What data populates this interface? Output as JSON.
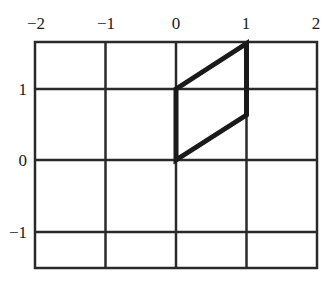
{
  "figure": {
    "x_ticks": [
      "−2",
      "−1",
      "0",
      "1",
      "2"
    ],
    "y_ticks": [
      "1",
      "0",
      "−1"
    ],
    "x_range": [
      -2,
      2
    ],
    "y_range": [
      -1.5,
      1.67
    ],
    "grid_color": "#2a2a2a",
    "shape_color": "#1a1a1a",
    "parallelogram_vertices": [
      [
        0,
        0
      ],
      [
        0,
        1
      ],
      [
        1,
        1.65
      ],
      [
        1,
        0.65
      ]
    ]
  }
}
